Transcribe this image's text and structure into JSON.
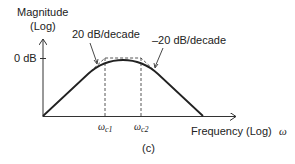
{
  "figure": {
    "type": "bode-magnitude-bandpass",
    "caption": "(c)",
    "y_axis": {
      "label_line1": "Magnitude",
      "label_line2": "(Log)",
      "tick_label": "0 dB"
    },
    "x_axis": {
      "label": "Frequency (Log)",
      "symbol": "ω"
    },
    "annotations": {
      "rising_slope": "20 dB/decade",
      "falling_slope": "–20 dB/decade"
    },
    "corner_frequencies": [
      {
        "base": "ω",
        "sub": "c1"
      },
      {
        "base": "ω",
        "sub": "c2"
      }
    ],
    "colors": {
      "line": "#222222",
      "dashed": "#444444",
      "background": "#ffffff"
    }
  }
}
